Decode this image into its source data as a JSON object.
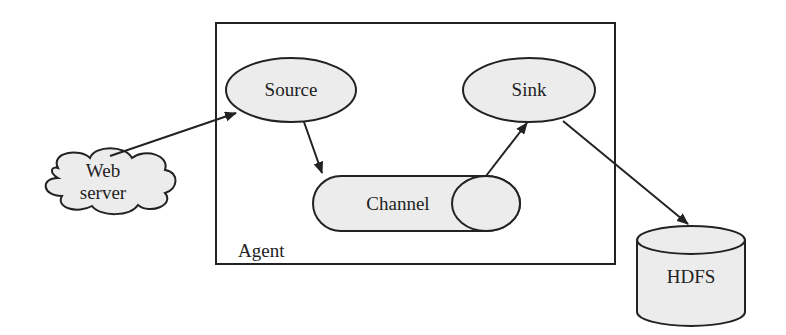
{
  "diagram": {
    "container": {
      "label": "Agent"
    },
    "nodes": {
      "web_server": {
        "line1": "Web",
        "line2": "server"
      },
      "source": {
        "label": "Source"
      },
      "sink": {
        "label": "Sink"
      },
      "channel": {
        "label": "Channel"
      },
      "hdfs": {
        "label": "HDFS"
      }
    },
    "edges": [
      {
        "from": "Web server",
        "to": "Source"
      },
      {
        "from": "Source",
        "to": "Channel"
      },
      {
        "from": "Channel",
        "to": "Sink"
      },
      {
        "from": "Sink",
        "to": "HDFS"
      }
    ],
    "colors": {
      "fill": "#ececec",
      "stroke": "#222222"
    }
  }
}
